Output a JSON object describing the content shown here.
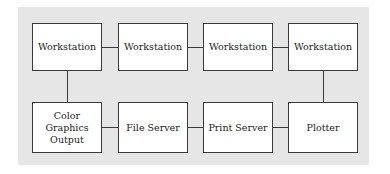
{
  "diagram": {
    "type": "network topology",
    "top_row": [
      "Workstation",
      "Workstation",
      "Workstation",
      "Workstation"
    ],
    "bottom_row": [
      "Color Graphics Output",
      "File Server",
      "Print Server",
      "Plotter"
    ],
    "bottom_row_lines": {
      "color_graphics": [
        "Color",
        "Graphics",
        "Output"
      ]
    },
    "connections": [
      [
        "top_row.0",
        "top_row.1"
      ],
      [
        "top_row.1",
        "top_row.2"
      ],
      [
        "top_row.2",
        "top_row.3"
      ],
      [
        "top_row.0",
        "bottom_row.0"
      ],
      [
        "top_row.3",
        "bottom_row.3"
      ],
      [
        "bottom_row.0",
        "bottom_row.1"
      ],
      [
        "bottom_row.1",
        "bottom_row.2"
      ],
      [
        "bottom_row.2",
        "bottom_row.3"
      ]
    ],
    "colors": {
      "panel": "#e6e6e6",
      "node_fill": "#ffffff",
      "line": "#3a3a3a"
    }
  }
}
